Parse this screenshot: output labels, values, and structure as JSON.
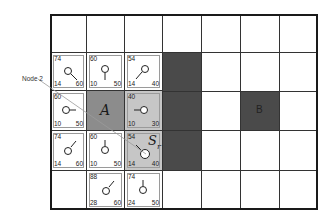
{
  "diagram": {
    "grid": {
      "cols": 7,
      "rows": 5
    },
    "colors": {
      "obstacle": "#4a4a4a",
      "start": "#8c8c8c",
      "current": "#c6c6c6",
      "open": "#ffffff",
      "line": "#333333"
    },
    "callout": {
      "label": "Node 2"
    },
    "labels": {
      "start": "A",
      "goal": "B",
      "current": "S",
      "current_sub": "r"
    },
    "nodes": [
      {
        "row": 1,
        "col": 0,
        "g": "74",
        "h": "14",
        "f": "60",
        "dir": "se"
      },
      {
        "row": 1,
        "col": 1,
        "g": "60",
        "h": "10",
        "f": "50",
        "dir": "s"
      },
      {
        "row": 1,
        "col": 2,
        "g": "54",
        "h": "14",
        "f": "40",
        "dir": "sw"
      },
      {
        "row": 2,
        "col": 0,
        "g": "60",
        "h": "10",
        "f": "50",
        "dir": "e"
      },
      {
        "row": 2,
        "col": 2,
        "g": "40",
        "h": "10",
        "f": "30",
        "dir": "w"
      },
      {
        "row": 3,
        "col": 0,
        "g": "74",
        "h": "14",
        "f": "60",
        "dir": "ne"
      },
      {
        "row": 3,
        "col": 1,
        "g": "60",
        "h": "10",
        "f": "50",
        "dir": "n"
      },
      {
        "row": 3,
        "col": 2,
        "g": "54",
        "h": "14",
        "f": "40",
        "dir": "nw"
      },
      {
        "row": 4,
        "col": 1,
        "g": "88",
        "h": "28",
        "f": "60",
        "dir": "ne"
      },
      {
        "row": 4,
        "col": 2,
        "g": "74",
        "h": "24",
        "f": "50",
        "dir": "n"
      }
    ]
  }
}
